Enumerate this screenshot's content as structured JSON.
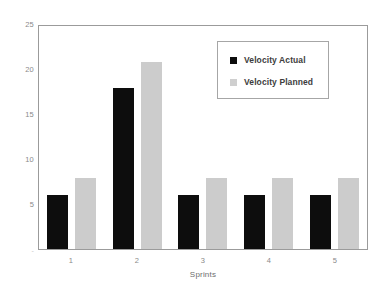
{
  "chart_data": {
    "type": "bar",
    "title": "",
    "xlabel": "Sprints",
    "ylabel": "",
    "categories": [
      "1",
      "2",
      "3",
      "4",
      "5"
    ],
    "series": [
      {
        "name": "Velocity Actual",
        "color": "#0D0D0D",
        "values": [
          6,
          18,
          6,
          6,
          6
        ]
      },
      {
        "name": "Velocity Planned",
        "color": "#CCCCCC",
        "values": [
          8,
          21,
          8,
          8,
          8
        ]
      }
    ],
    "ylim": [
      0,
      25
    ],
    "yticks": [
      25,
      20,
      15,
      10,
      5
    ],
    "y_zero_mark": "-",
    "grid": false,
    "legend_position": "top-right",
    "plot_border": true
  },
  "legend": {
    "items": [
      {
        "label": "Velocity Actual",
        "swatch": "black-square-swatch"
      },
      {
        "label": "Velocity Planned",
        "swatch": "gray-square-swatch"
      }
    ]
  },
  "axes": {
    "x_title": "Sprints",
    "x_ticks": [
      "1",
      "2",
      "3",
      "4",
      "5"
    ],
    "y_ticks": [
      "25",
      "20",
      "15",
      "10",
      "5"
    ],
    "y_zero": "-"
  }
}
